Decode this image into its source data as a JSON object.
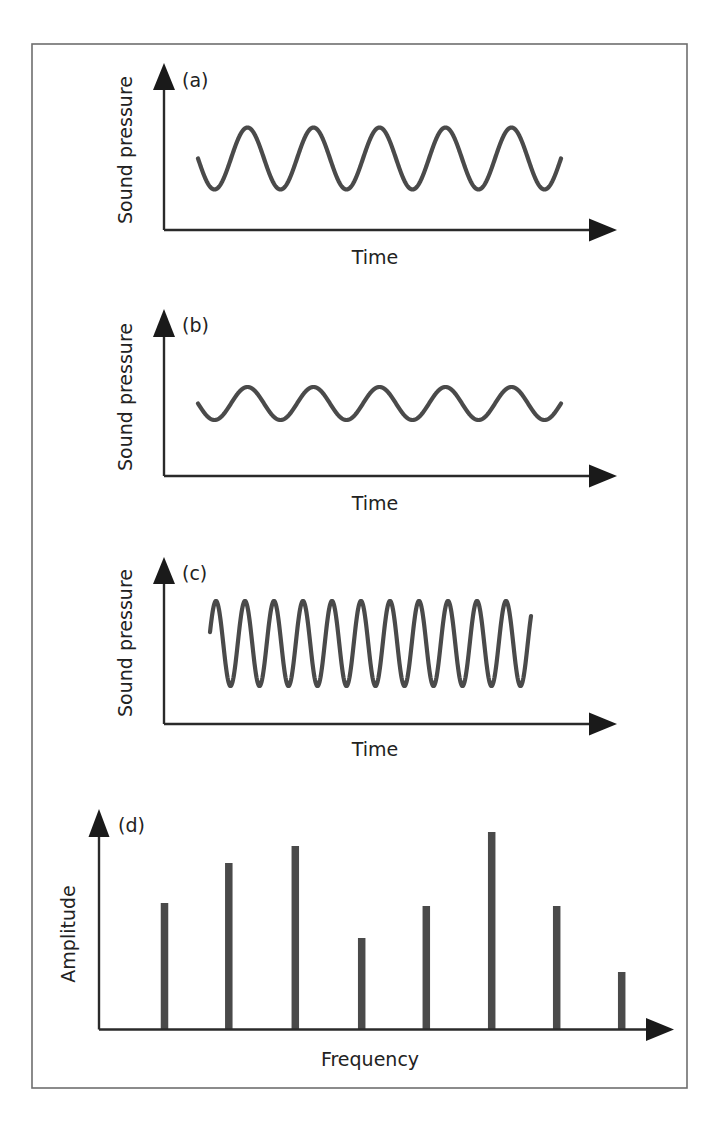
{
  "figure": {
    "panels": [
      {
        "id": "a",
        "panel_label": "(a)",
        "ylabel": "Sound pressure",
        "xlabel": "Time",
        "description": "Low frequency, large amplitude sine wave"
      },
      {
        "id": "b",
        "panel_label": "(b)",
        "ylabel": "Sound pressure",
        "xlabel": "Time",
        "description": "Same frequency as (a), smaller amplitude"
      },
      {
        "id": "c",
        "panel_label": "(c)",
        "ylabel": "Sound pressure",
        "xlabel": "Time",
        "description": "Higher frequency, larger amplitude sine wave"
      },
      {
        "id": "d",
        "panel_label": "(d)",
        "ylabel": "Amplitude",
        "xlabel": "Frequency",
        "description": "Amplitude spectrum with 8 frequency components"
      }
    ]
  },
  "chart_data": [
    {
      "type": "line",
      "title": "(a)",
      "xlabel": "Time",
      "ylabel": "Sound pressure",
      "series": [
        {
          "name": "waveform",
          "shape": "sine",
          "cycles": 5.5,
          "relative_amplitude": 1.0,
          "relative_frequency": 1.0
        }
      ],
      "grid": false,
      "ticks": false
    },
    {
      "type": "line",
      "title": "(b)",
      "xlabel": "Time",
      "ylabel": "Sound pressure",
      "series": [
        {
          "name": "waveform",
          "shape": "sine",
          "cycles": 5.5,
          "relative_amplitude": 0.53,
          "relative_frequency": 1.0
        }
      ],
      "grid": false,
      "ticks": false
    },
    {
      "type": "line",
      "title": "(c)",
      "xlabel": "Time",
      "ylabel": "Sound pressure",
      "series": [
        {
          "name": "waveform",
          "shape": "sine",
          "cycles": 11,
          "relative_amplitude": 1.33,
          "relative_frequency": 2.28
        }
      ],
      "grid": false,
      "ticks": false
    },
    {
      "type": "bar",
      "title": "(d)",
      "xlabel": "Frequency",
      "ylabel": "Amplitude",
      "categories": [
        "f1",
        "f2",
        "f3",
        "f4",
        "f5",
        "f6",
        "f7",
        "f8"
      ],
      "values": [
        63,
        84,
        93,
        46,
        61,
        100,
        61,
        29
      ],
      "value_units": "relative amplitude (% of tallest component)",
      "grid": false,
      "ticks": false
    }
  ],
  "geometry": {
    "frame": {
      "x": 32,
      "y": 44,
      "w": 655,
      "h": 1044
    },
    "waves": [
      {
        "x0": 198,
        "x1": 561,
        "center": 158.5,
        "amp": 31,
        "period": 66,
        "phase": "sin-down",
        "axis_x": 164,
        "axis_top": 63,
        "axis_y": 230,
        "axis_end": 617,
        "ylabel_cx": 125,
        "ylabel_cy": 150,
        "plabel_x": 182,
        "plabel_y": 87,
        "xlabel_x": 375,
        "xlabel_y": 264
      },
      {
        "x0": 198,
        "x1": 561,
        "center": 403.5,
        "amp": 16.5,
        "period": 66,
        "phase": "sin-down",
        "axis_x": 164,
        "axis_top": 309,
        "axis_y": 476,
        "axis_end": 617,
        "ylabel_cx": 125,
        "ylabel_cy": 397,
        "plabel_x": 182,
        "plabel_y": 332,
        "xlabel_x": 375,
        "xlabel_y": 510
      },
      {
        "x0": 210,
        "x1": 531,
        "center": 643.5,
        "amp": 42.5,
        "period": 29,
        "phase": "cos",
        "peak_x": 216,
        "axis_x": 164,
        "axis_top": 557,
        "axis_y": 724,
        "axis_end": 617,
        "ylabel_cx": 125,
        "ylabel_cy": 643,
        "plabel_x": 182,
        "plabel_y": 580,
        "xlabel_x": 375,
        "xlabel_y": 756
      }
    ],
    "spectrum": {
      "axis_x": 99,
      "axis_top": 809,
      "axis_y": 1029.5,
      "axis_end": 673,
      "bar_width": 7.5,
      "bar_x": [
        164.5,
        228.8,
        295.3,
        361.7,
        426.3,
        491.7,
        556.7,
        621.7
      ],
      "bar_top": [
        903,
        863,
        846,
        938,
        906,
        832,
        906,
        972
      ],
      "ylabel_cx": 68,
      "ylabel_cy": 934,
      "plabel_x": 118,
      "plabel_y": 832,
      "xlabel_x": 370,
      "xlabel_y": 1066
    },
    "colors": {
      "ink": "#1a1a1a",
      "wave": "#4a4a4a",
      "frame": "#6e6e6e",
      "background": "#ffffff"
    }
  }
}
